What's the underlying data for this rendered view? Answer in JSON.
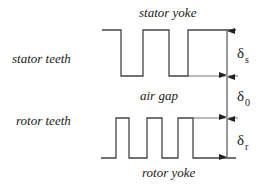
{
  "diagram": {
    "labels": {
      "stator_yoke": "stator yoke",
      "stator_teeth": "stator teeth",
      "air_gap": "air gap",
      "rotor_teeth": "rotor teeth",
      "rotor_yoke": "rotor yoke"
    },
    "dimensions": [
      {
        "symbol": "δ",
        "subscript": "s",
        "meaning": "stator tooth height"
      },
      {
        "symbol": "δ",
        "subscript": "0",
        "meaning": "air gap length"
      },
      {
        "symbol": "δ",
        "subscript": "r",
        "meaning": "rotor tooth height"
      }
    ],
    "colors": {
      "line": "#444444",
      "text": "#1a1a1a",
      "background": "#ffffff"
    }
  }
}
